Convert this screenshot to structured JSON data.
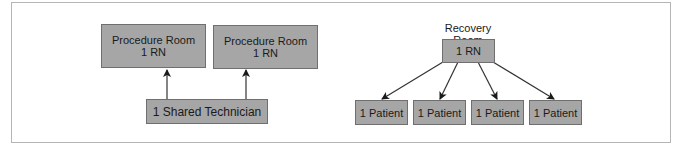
{
  "left_diagram": {
    "procedure_rooms": [
      {
        "title": "Procedure Room",
        "staff": "1 RN"
      },
      {
        "title": "Procedure Room",
        "staff": "1 RN"
      }
    ],
    "shared": {
      "label": "1 Shared Technician"
    }
  },
  "right_diagram": {
    "title": "Recovery Room",
    "nurse": {
      "label": "1 RN"
    },
    "patients": [
      {
        "label": "1 Patient"
      },
      {
        "label": "1 Patient"
      },
      {
        "label": "1 Patient"
      },
      {
        "label": "1 Patient"
      }
    ]
  },
  "colors": {
    "box_fill": "#a6a6a6",
    "box_border": "#6f6f6f",
    "arrow": "#1a1a1a",
    "frame": "#b5b5b5"
  }
}
